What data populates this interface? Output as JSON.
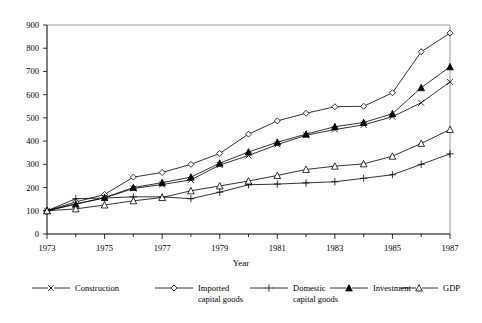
{
  "chart_data": {
    "type": "line",
    "title": "",
    "subtitle": "",
    "xlabel": "Year",
    "ylabel": "",
    "xlim": [
      1973,
      1987
    ],
    "ylim": [
      0,
      900
    ],
    "x": [
      1973,
      1974,
      1975,
      1976,
      1977,
      1978,
      1979,
      1980,
      1981,
      1982,
      1983,
      1984,
      1985,
      1986,
      1987
    ],
    "xticks": [
      1973,
      1975,
      1977,
      1979,
      1981,
      1983,
      1985,
      1987
    ],
    "xtick_labels": [
      "1973",
      "1975",
      "1977",
      "1979",
      "1981",
      "1983",
      "1985",
      "1987"
    ],
    "yticks": [
      0,
      100,
      200,
      300,
      400,
      500,
      600,
      700,
      800,
      900
    ],
    "ytick_labels": [
      "0",
      "100",
      "200",
      "300",
      "400",
      "500",
      "600",
      "700",
      "800",
      "900"
    ],
    "grid": false,
    "legend_position": "bottom",
    "series": [
      {
        "name": "Construction",
        "marker": "x-cross",
        "fill": "none",
        "values": [
          100,
          130,
          155,
          196,
          213,
          233,
          297,
          338,
          385,
          425,
          450,
          470,
          505,
          565,
          655
        ]
      },
      {
        "name": "Imported capital goods",
        "marker": "diamond-open",
        "fill": "open",
        "values": [
          100,
          138,
          170,
          245,
          265,
          300,
          347,
          430,
          487,
          520,
          548,
          550,
          608,
          785,
          865
        ]
      },
      {
        "name": "Domestic capital goods",
        "marker": "plus",
        "fill": "none",
        "values": [
          100,
          152,
          155,
          160,
          160,
          152,
          180,
          212,
          215,
          220,
          225,
          240,
          255,
          300,
          345
        ]
      },
      {
        "name": "Investment",
        "marker": "triangle-solid",
        "fill": "solid",
        "values": [
          100,
          128,
          157,
          200,
          221,
          245,
          305,
          353,
          395,
          430,
          462,
          480,
          518,
          630,
          720
        ]
      },
      {
        "name": "GDP",
        "marker": "triangle-open",
        "fill": "open",
        "values": [
          100,
          108,
          125,
          143,
          157,
          186,
          207,
          228,
          252,
          278,
          292,
          302,
          335,
          390,
          450
        ]
      }
    ]
  },
  "legend": {
    "items": [
      {
        "label_line1": "Construction",
        "label_line2": ""
      },
      {
        "label_line1": "Imported",
        "label_line2": "capital goods"
      },
      {
        "label_line1": "Domestic",
        "label_line2": "capital goods"
      },
      {
        "label_line1": "Investment",
        "label_line2": ""
      },
      {
        "label_line1": "GDP",
        "label_line2": ""
      }
    ]
  },
  "colors": {
    "line": "#000000",
    "frame": "#808080",
    "background": "#ffffff"
  }
}
